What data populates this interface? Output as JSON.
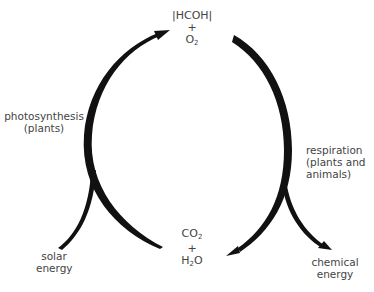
{
  "diagram": {
    "top_compound": {
      "line1": "|HCOH|",
      "plus": "+",
      "o2_base": "O",
      "o2_sub": "2"
    },
    "bottom_compound": {
      "co2_base": "CO",
      "co2_sub": "2",
      "plus": "+",
      "h2o_pre": "H",
      "h2o_sub": "2",
      "h2o_post": "O"
    },
    "left_process": {
      "line1": "photosynthesis",
      "line2": "(plants)"
    },
    "right_process": {
      "line1": "respiration",
      "line2": "(plants and",
      "line3": "animals)"
    },
    "input": {
      "line1": "solar",
      "line2": "energy"
    },
    "output": {
      "line1": "chemical",
      "line2": "energy"
    },
    "colors": {
      "arrow": "#111111",
      "text": "#444444"
    }
  }
}
